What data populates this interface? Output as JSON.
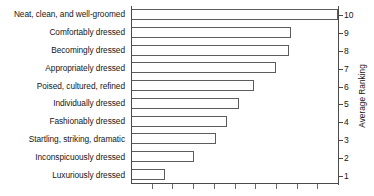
{
  "chart_data": {
    "type": "bar",
    "orientation": "horizontal",
    "title": "",
    "xlabel": "",
    "ylabel": "Average Ranking",
    "ylim": [
      0,
      10
    ],
    "grid": false,
    "legend": null,
    "value_axis_position": "right",
    "value_axis_ticks": [
      10,
      9,
      8,
      7,
      6,
      5,
      4,
      3,
      2,
      1
    ],
    "x_axis_tick_count": 9,
    "categories": [
      "Neat, clean, and well-groomed",
      "Comfortably dressed",
      "Becomingly dressed",
      "Appropriately dressed",
      "Poised, cultured, refined",
      "Individually dressed",
      "Fashionably dressed",
      "Startling, striking, dramatic",
      "Inconspicuously dressed",
      "Luxuriously dressed"
    ],
    "values": [
      10.0,
      7.7,
      7.6,
      7.0,
      5.9,
      5.2,
      4.6,
      4.1,
      3.0,
      1.6
    ],
    "bar_percent": [
      100,
      77,
      76,
      70,
      59,
      52,
      46,
      41,
      30,
      16
    ]
  },
  "axis": {
    "value_axis_title": "Average Ranking",
    "tick_labels": [
      "10",
      "9",
      "8",
      "7",
      "6",
      "5",
      "4",
      "3",
      "2",
      "1"
    ]
  },
  "style": {
    "bar_fill": "#ffffff",
    "bar_stroke": "#5c5c5c",
    "axis_color": "#4a4a4a",
    "text_color": "#161616",
    "background": "#ffffff"
  }
}
